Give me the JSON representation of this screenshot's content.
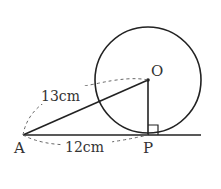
{
  "diagram": {
    "points": {
      "A": {
        "label": "A"
      },
      "O": {
        "label": "O"
      },
      "P": {
        "label": "P"
      }
    },
    "measurements": {
      "AO": "13cm",
      "AP": "12cm"
    },
    "colors": {
      "stroke": "#222222",
      "dash": "#666666",
      "text": "#333333"
    }
  }
}
